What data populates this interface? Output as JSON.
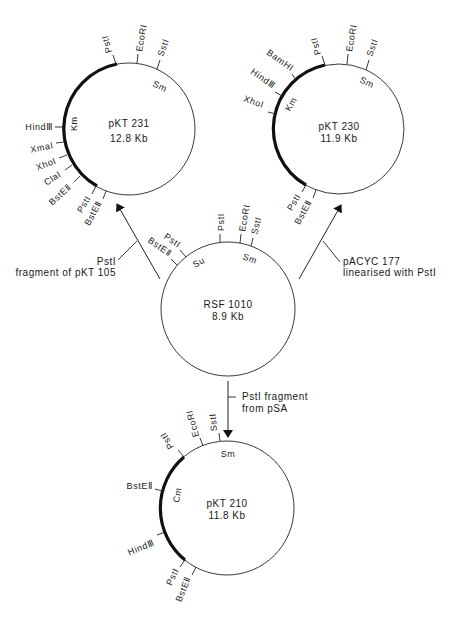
{
  "plasmids": {
    "pkt231": {
      "name": "pKT 231",
      "size": "12.8 Kb",
      "genes": {
        "km": "Km",
        "sm": "Sm"
      },
      "sites": {
        "psti_top": "PstI",
        "ecori": "EcoRI",
        "ssti": "SstI",
        "hindiii": "HindⅢ",
        "xmai": "XmaI",
        "xhoi": "XhoI",
        "clai": "ClaI",
        "bsteii_a": "BstEⅡ",
        "psti_bottom": "PstI",
        "bsteii_b": "BstEⅡ"
      }
    },
    "pkt230": {
      "name": "pKT 230",
      "size": "11.9 Kb",
      "genes": {
        "km": "Km",
        "sm": "Sm"
      },
      "sites": {
        "bamhi": "BamHI",
        "hindiii": "HindⅢ",
        "xhoi": "XhoI",
        "psti_top": "PstI",
        "ecori": "EcoRI",
        "ssti": "SstI",
        "psti_bottom": "PstI",
        "bsteii": "BstEⅡ"
      }
    },
    "rsf1010": {
      "name": "RSF 1010",
      "size": "8.9 Kb",
      "genes": {
        "su": "Su",
        "sm": "Sm"
      },
      "sites": {
        "psti_left": "PstI",
        "bsteii": "BstEⅡ",
        "psti_top": "PstI",
        "ecori": "EcoRI",
        "ssti": "SstI"
      }
    },
    "pkt210": {
      "name": "pKT 210",
      "size": "11.8 Kb",
      "genes": {
        "cm": "Cm",
        "sm": "Sm"
      },
      "sites": {
        "psti_top": "PstI",
        "ecori": "EcoRI",
        "ssti": "SstI",
        "bsteii_top": "BstEⅡ",
        "hindiii": "HindⅢ",
        "psti_bottom": "PstI",
        "bsteii_bottom": "BstEⅡ"
      }
    }
  },
  "arrows": {
    "left": {
      "line1": "PstI",
      "line2": "fragment of pKT 105"
    },
    "right": {
      "line1": "pACYC 177",
      "line2": "linearised with PstI"
    },
    "down": {
      "line1": "PstI fragment",
      "line2": "from pSA"
    }
  }
}
